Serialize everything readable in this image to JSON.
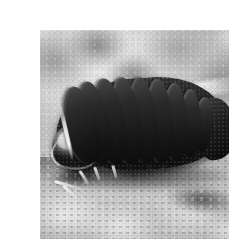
{
  "image": {
    "kind": "photograph",
    "color_mode": "black-and-white",
    "width_px": 229,
    "height_px": 239,
    "subject": "pillbug",
    "subject_common_names": "pillbug, roly-poly, woodlouse",
    "subject_group": "terrestrial isopod crustacean",
    "orientation": "head at lower left, tail at upper right",
    "setting": "rocky sandy ground",
    "focus": "subject sharp, background blurred",
    "margins": {
      "top_px": 14,
      "left_px": 0,
      "right_px": 25,
      "bottom_px": 14,
      "margin_color": "#ffffff"
    },
    "plate": {
      "x": 0,
      "y": 14,
      "width": 205,
      "height": 211
    }
  },
  "palette": {
    "paper_white": "#ffffff",
    "background_light": "#e2e2e2",
    "background_mid": "#b9b9b9",
    "ground_dark": "#3a3a3a",
    "body_dark": "#161616",
    "body_mid": "#2f2f2f",
    "ridge_highlight": "#ededed",
    "head_highlight": "#fbfbfb"
  },
  "subject": {
    "body": {
      "segment_count": 9,
      "segments": [
        {
          "left": 18,
          "top": 14,
          "width": 34,
          "height": 78,
          "rotate": -13
        },
        {
          "left": 32,
          "top": 9,
          "width": 32,
          "height": 84,
          "rotate": -11
        },
        {
          "left": 48,
          "top": 6,
          "width": 31,
          "height": 87,
          "rotate": -9
        },
        {
          "left": 65,
          "top": 5,
          "width": 30,
          "height": 88,
          "rotate": -7
        },
        {
          "left": 82,
          "top": 5,
          "width": 29,
          "height": 87,
          "rotate": -5
        },
        {
          "left": 99,
          "top": 7,
          "width": 28,
          "height": 84,
          "rotate": -3
        },
        {
          "left": 116,
          "top": 11,
          "width": 26,
          "height": 78,
          "rotate": -1
        },
        {
          "left": 132,
          "top": 17,
          "width": 23,
          "height": 68,
          "rotate": 2
        },
        {
          "left": 147,
          "top": 25,
          "width": 19,
          "height": 55,
          "rotate": 5
        }
      ]
    },
    "appendages": {
      "antennae": [
        {
          "left": 8,
          "top": 112,
          "width": 30,
          "height": 3,
          "rotate": 16
        },
        {
          "left": 14,
          "top": 120,
          "width": 24,
          "height": 3,
          "rotate": 42
        }
      ],
      "legs_light": [
        {
          "left": 30,
          "top": 104,
          "width": 16,
          "height": 3,
          "rotate": 58
        },
        {
          "left": 44,
          "top": 100,
          "width": 14,
          "height": 3,
          "rotate": 70
        },
        {
          "left": 62,
          "top": 98,
          "width": 13,
          "height": 3,
          "rotate": 74
        }
      ],
      "legs_dark": [
        {
          "left": 78,
          "top": 96,
          "width": 15,
          "height": 4,
          "rotate": 72
        },
        {
          "left": 96,
          "top": 94,
          "width": 14,
          "height": 4,
          "rotate": 76
        },
        {
          "left": 112,
          "top": 92,
          "width": 13,
          "height": 4,
          "rotate": 80
        }
      ]
    }
  },
  "caption": ""
}
